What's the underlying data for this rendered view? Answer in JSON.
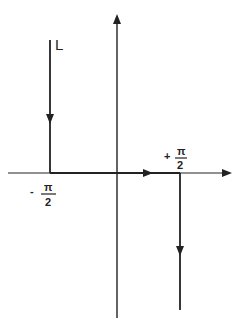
{
  "diagram": {
    "type": "contour-path",
    "contour_label": "L",
    "left_marker": {
      "sign": "-",
      "numerator": "π",
      "denominator": "2"
    },
    "right_marker": {
      "sign": "+",
      "numerator": "π",
      "denominator": "2"
    },
    "axes": {
      "horizontal": "real-axis",
      "vertical": "imaginary-axis"
    },
    "path_segments": [
      {
        "name": "descending-left",
        "direction": "down"
      },
      {
        "name": "horizontal-along-axis",
        "direction": "right"
      },
      {
        "name": "descending-right",
        "direction": "down"
      }
    ],
    "colors": {
      "ink": "#222222",
      "background": "#ffffff"
    }
  }
}
